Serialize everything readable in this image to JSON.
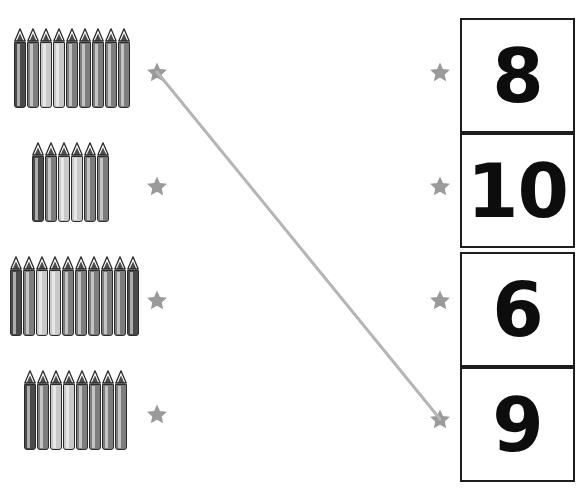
{
  "worksheet": {
    "title": "Count and match crayons to numbers",
    "width": 585,
    "height": 491,
    "background": "#ffffff"
  },
  "palette": {
    "crayon_dark": "#4a4a4a",
    "crayon_mid": "#7d7d7d",
    "crayon_light": "#c9c9c9",
    "crayon_outline": "#2b2b2b",
    "star_color": "#9a9a9a",
    "line_color": "#b5b5b5",
    "box_border": "#1d1d1d",
    "number_color": "#0d0d0d"
  },
  "left_column": {
    "groups": [
      {
        "id": "crayon-group-1",
        "count": 9,
        "x": 14,
        "y": 28,
        "shades": [
          "dark",
          "mid",
          "light",
          "light",
          "mid",
          "mid",
          "mid",
          "mid",
          "mid"
        ]
      },
      {
        "id": "crayon-group-2",
        "count": 6,
        "x": 32,
        "y": 142,
        "shades": [
          "dark",
          "mid",
          "light",
          "light",
          "mid",
          "mid"
        ]
      },
      {
        "id": "crayon-group-3",
        "count": 10,
        "x": 10,
        "y": 256,
        "shades": [
          "dark",
          "mid",
          "light",
          "light",
          "mid",
          "mid",
          "mid",
          "mid",
          "mid",
          "dark"
        ]
      },
      {
        "id": "crayon-group-4",
        "count": 8,
        "x": 24,
        "y": 370,
        "shades": [
          "dark",
          "mid",
          "light",
          "light",
          "mid",
          "mid",
          "mid",
          "mid"
        ]
      }
    ],
    "stars": [
      {
        "id": "left-star-1",
        "x": 146,
        "y": 61,
        "row": 1
      },
      {
        "id": "left-star-2",
        "x": 146,
        "y": 175,
        "row": 2
      },
      {
        "id": "left-star-3",
        "x": 146,
        "y": 289,
        "row": 3
      },
      {
        "id": "left-star-4",
        "x": 146,
        "y": 403,
        "row": 4
      }
    ]
  },
  "right_column": {
    "stars": [
      {
        "id": "right-star-1",
        "x": 429,
        "y": 61,
        "row": 1
      },
      {
        "id": "right-star-2",
        "x": 429,
        "y": 175,
        "row": 2
      },
      {
        "id": "right-star-3",
        "x": 429,
        "y": 289,
        "row": 3
      },
      {
        "id": "right-star-4",
        "x": 429,
        "y": 408,
        "row": 4
      }
    ],
    "boxes": [
      {
        "id": "number-box-1",
        "value": "8",
        "y": 18
      },
      {
        "id": "number-box-2",
        "value": "10",
        "y": 133
      },
      {
        "id": "number-box-3",
        "value": "6",
        "y": 252
      },
      {
        "id": "number-box-4",
        "value": "9",
        "y": 367
      }
    ]
  },
  "connections": [
    {
      "id": "connection-1",
      "from": "left-star-1",
      "to": "right-star-4",
      "from_label": "9 crayons",
      "to_label": "9",
      "x1": 157,
      "y1": 72,
      "x2": 440,
      "y2": 419,
      "color": "#b5b5b5",
      "width": 3
    }
  ]
}
